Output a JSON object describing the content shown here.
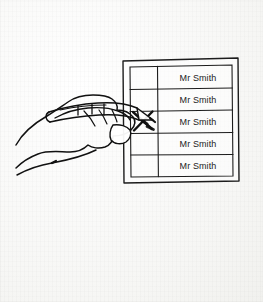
{
  "illustration": {
    "title": "Hand marking a ballot paper with a pen",
    "background_color": "#fbfbf9",
    "ink_color": "#1c1c1c"
  },
  "ballot": {
    "name": "ballot-paper",
    "rows": [
      {
        "candidate": "Mr Smith",
        "marked": false,
        "mark": ""
      },
      {
        "candidate": "Mr Smith",
        "marked": false,
        "mark": ""
      },
      {
        "candidate": "Mr Smith",
        "marked": true,
        "mark": "X"
      },
      {
        "candidate": "Mr Smith",
        "marked": false,
        "mark": ""
      },
      {
        "candidate": "Mr Smith",
        "marked": false,
        "mark": ""
      }
    ],
    "marked_row_index": 3,
    "row_count": 5,
    "columns": [
      "checkbox",
      "candidate-name"
    ]
  },
  "hand": {
    "name": "hand-holding-pen",
    "pen_label": "pen"
  }
}
